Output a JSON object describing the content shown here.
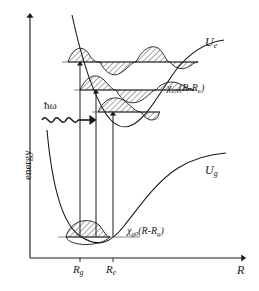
{
  "figure": {
    "type": "potential-energy-diagram"
  },
  "axes": {
    "y_label": "energy",
    "x_label": "R",
    "x_ticks": [
      {
        "id": "Rg",
        "base": "R",
        "sub": "g",
        "x": 80
      },
      {
        "id": "Re",
        "base": "R",
        "sub": "e",
        "x": 113
      }
    ]
  },
  "curves": [
    {
      "name": "excited-state-potential",
      "label_base": "U",
      "label_sub": "e",
      "label_x": 205,
      "label_y": 42
    },
    {
      "name": "ground-state-potential",
      "label_base": "U",
      "label_sub": "g",
      "label_x": 205,
      "label_y": 170
    }
  ],
  "wavefunctions": [
    {
      "name": "excited-vibrational-wavefunction",
      "symbol": "χ",
      "sub": "eN",
      "arg_open": "(R-R",
      "arg_sub": "e",
      "arg_close": ")",
      "label_x": 168,
      "label_y": 88
    },
    {
      "name": "ground-vibrational-wavefunction",
      "symbol": "χ",
      "sub": "g0",
      "arg_open": "(R-R",
      "arg_sub": "g",
      "arg_close": ")",
      "label_x": 128,
      "label_y": 230
    }
  ],
  "photon": {
    "label": "ħω",
    "label_x": 44,
    "label_y": 104
  },
  "transitions": [
    {
      "name": "transition-arrow-1",
      "x": 80,
      "y_from": 237,
      "y_to": 60
    },
    {
      "name": "transition-arrow-2",
      "x": 96,
      "y_from": 237,
      "y_to": 88
    },
    {
      "name": "transition-arrow-3",
      "x": 113,
      "y_from": 237,
      "y_to": 111
    }
  ],
  "levels": [
    {
      "name": "vibrational-level-upper",
      "y": 62
    },
    {
      "name": "vibrational-level-middle",
      "y": 90
    },
    {
      "name": "vibrational-level-lower",
      "y": 112
    },
    {
      "name": "vibrational-level-ground",
      "y": 237
    }
  ],
  "colors": {
    "stroke": "#1a1a1a",
    "background": "#ffffff",
    "hatch": "#1a1a1a"
  }
}
